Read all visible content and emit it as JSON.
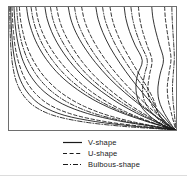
{
  "figure": {
    "width": 187,
    "height": 183,
    "background": "#ffffff",
    "frame_color": "#6e6e6e",
    "line_color": "#1a1a1a"
  },
  "legend": {
    "position": "below-plot",
    "entries": [
      {
        "label": "V-shape",
        "style": "solid",
        "color": "#1a1a1a"
      },
      {
        "label": "U-shape",
        "style": "dashed",
        "color": "#1a1a1a"
      },
      {
        "label": "Bulbous-shape",
        "style": "dashdot",
        "color": "#1a1a1a"
      }
    ]
  },
  "chart_data": {
    "type": "line",
    "title": "",
    "subtitle": "",
    "xlabel": "",
    "ylabel": "",
    "xlim": [
      0,
      1
    ],
    "ylim": [
      0,
      1
    ],
    "xticks": [],
    "yticks": [],
    "xticklabels": [],
    "yticklabels": [],
    "grid": false,
    "legend_position": "below",
    "annotations": [],
    "series": [
      {
        "name": "V-shape",
        "style": "solid",
        "color": "#1a1a1a",
        "curves": [
          {
            "x": [
              0.01,
              0.012,
              0.016,
              0.024,
              0.04,
              0.07,
              0.12,
              0.2,
              0.33,
              0.52,
              0.74,
              0.92,
              0.985
            ],
            "y": [
              1.0,
              0.9,
              0.79,
              0.66,
              0.53,
              0.4,
              0.29,
              0.195,
              0.12,
              0.068,
              0.032,
              0.01,
              0.002
            ]
          },
          {
            "x": [
              0.03,
              0.034,
              0.042,
              0.058,
              0.086,
              0.135,
              0.21,
              0.32,
              0.47,
              0.65,
              0.83,
              0.945,
              0.992
            ],
            "y": [
              1.0,
              0.905,
              0.8,
              0.68,
              0.555,
              0.428,
              0.312,
              0.212,
              0.134,
              0.076,
              0.036,
              0.012,
              0.002
            ]
          },
          {
            "x": [
              0.105,
              0.115,
              0.135,
              0.17,
              0.225,
              0.305,
              0.41,
              0.535,
              0.67,
              0.8,
              0.9,
              0.96,
              0.995
            ],
            "y": [
              1.0,
              0.91,
              0.81,
              0.695,
              0.572,
              0.445,
              0.328,
              0.224,
              0.142,
              0.08,
              0.038,
              0.013,
              0.002
            ]
          },
          {
            "x": [
              0.215,
              0.228,
              0.255,
              0.3,
              0.365,
              0.45,
              0.552,
              0.66,
              0.765,
              0.858,
              0.925,
              0.97,
              0.996
            ],
            "y": [
              1.0,
              0.905,
              0.8,
              0.682,
              0.556,
              0.43,
              0.315,
              0.215,
              0.136,
              0.078,
              0.037,
              0.012,
              0.002
            ]
          },
          {
            "x": [
              0.355,
              0.37,
              0.4,
              0.45,
              0.518,
              0.6,
              0.69,
              0.778,
              0.855,
              0.915,
              0.955,
              0.98,
              0.997
            ],
            "y": [
              1.0,
              0.902,
              0.795,
              0.675,
              0.548,
              0.422,
              0.308,
              0.21,
              0.133,
              0.075,
              0.035,
              0.012,
              0.002
            ]
          },
          {
            "x": [
              0.52,
              0.534,
              0.562,
              0.606,
              0.665,
              0.732,
              0.8,
              0.862,
              0.912,
              0.948,
              0.972,
              0.988,
              0.998
            ],
            "y": [
              1.0,
              0.9,
              0.792,
              0.67,
              0.542,
              0.416,
              0.302,
              0.205,
              0.13,
              0.073,
              0.034,
              0.011,
              0.002
            ]
          },
          {
            "x": [
              0.69,
              0.7,
              0.722,
              0.755,
              0.798,
              0.77,
              0.76,
              0.772,
              0.805,
              0.855,
              0.905,
              0.955,
              0.998
            ],
            "y": [
              1.0,
              0.905,
              0.8,
              0.69,
              0.565,
              0.45,
              0.345,
              0.248,
              0.166,
              0.1,
              0.052,
              0.018,
              0.002
            ]
          },
          {
            "x": [
              0.855,
              0.862,
              0.878,
              0.9,
              0.925,
              0.905,
              0.892,
              0.896,
              0.918,
              0.945,
              0.968,
              0.985,
              0.999
            ],
            "y": [
              1.0,
              0.908,
              0.806,
              0.696,
              0.572,
              0.455,
              0.35,
              0.252,
              0.168,
              0.102,
              0.053,
              0.018,
              0.002
            ]
          }
        ]
      },
      {
        "name": "U-shape",
        "style": "dashed",
        "color": "#1a1a1a",
        "curves": [
          {
            "x": [
              0.018,
              0.021,
              0.027,
              0.038,
              0.06,
              0.098,
              0.158,
              0.248,
              0.385,
              0.57,
              0.775,
              0.93,
              0.988
            ],
            "y": [
              1.0,
              0.902,
              0.794,
              0.668,
              0.538,
              0.41,
              0.297,
              0.2,
              0.125,
              0.07,
              0.033,
              0.011,
              0.002
            ]
          },
          {
            "x": [
              0.062,
              0.068,
              0.082,
              0.106,
              0.148,
              0.212,
              0.3,
              0.415,
              0.552,
              0.705,
              0.85,
              0.95,
              0.993
            ],
            "y": [
              1.0,
              0.906,
              0.802,
              0.684,
              0.558,
              0.432,
              0.316,
              0.216,
              0.137,
              0.078,
              0.037,
              0.012,
              0.002
            ]
          },
          {
            "x": [
              0.16,
              0.172,
              0.196,
              0.238,
              0.3,
              0.382,
              0.482,
              0.595,
              0.712,
              0.822,
              0.908,
              0.962,
              0.996
            ],
            "y": [
              1.0,
              0.908,
              0.806,
              0.69,
              0.566,
              0.44,
              0.323,
              0.221,
              0.14,
              0.079,
              0.038,
              0.013,
              0.002
            ]
          },
          {
            "x": [
              0.285,
              0.3,
              0.328,
              0.375,
              0.44,
              0.522,
              0.618,
              0.715,
              0.805,
              0.88,
              0.935,
              0.972,
              0.997
            ],
            "y": [
              1.0,
              0.904,
              0.798,
              0.68,
              0.552,
              0.426,
              0.311,
              0.212,
              0.134,
              0.076,
              0.036,
              0.012,
              0.002
            ]
          },
          {
            "x": [
              0.435,
              0.45,
              0.48,
              0.528,
              0.592,
              0.668,
              0.748,
              0.822,
              0.884,
              0.932,
              0.964,
              0.984,
              0.998
            ],
            "y": [
              1.0,
              0.901,
              0.793,
              0.672,
              0.544,
              0.418,
              0.304,
              0.207,
              0.131,
              0.074,
              0.035,
              0.011,
              0.002
            ]
          },
          {
            "x": [
              0.605,
              0.618,
              0.644,
              0.684,
              0.736,
              0.79,
              0.838,
              0.872,
              0.89,
              0.912,
              0.945,
              0.975,
              0.998
            ],
            "y": [
              1.0,
              0.903,
              0.796,
              0.678,
              0.552,
              0.43,
              0.322,
              0.226,
              0.15,
              0.09,
              0.045,
              0.015,
              0.002
            ]
          },
          {
            "x": [
              0.775,
              0.783,
              0.8,
              0.826,
              0.856,
              0.842,
              0.832,
              0.84,
              0.87,
              0.91,
              0.948,
              0.976,
              0.999
            ],
            "y": [
              1.0,
              0.906,
              0.802,
              0.692,
              0.568,
              0.452,
              0.348,
              0.25,
              0.167,
              0.101,
              0.052,
              0.018,
              0.002
            ]
          },
          {
            "x": [
              0.932,
              0.936,
              0.946,
              0.958,
              0.97,
              0.958,
              0.948,
              0.952,
              0.966,
              0.978,
              0.988,
              0.995,
              0.999
            ],
            "y": [
              1.0,
              0.91,
              0.81,
              0.7,
              0.578,
              0.46,
              0.355,
              0.256,
              0.172,
              0.105,
              0.055,
              0.019,
              0.002
            ]
          }
        ]
      },
      {
        "name": "Bulbous-shape",
        "style": "dashdot",
        "color": "#1a1a1a",
        "curves": [
          {
            "x": [
              0.004,
              0.005,
              0.007,
              0.012,
              0.022,
              0.044,
              0.085,
              0.155,
              0.27,
              0.45,
              0.68,
              0.89,
              0.982
            ],
            "y": [
              1.0,
              0.898,
              0.786,
              0.656,
              0.524,
              0.394,
              0.284,
              0.19,
              0.117,
              0.065,
              0.03,
              0.01,
              0.002
            ]
          },
          {
            "x": [
              0.046,
              0.051,
              0.062,
              0.082,
              0.118,
              0.174,
              0.255,
              0.366,
              0.508,
              0.672,
              0.838,
              0.946,
              0.992
            ],
            "y": [
              1.0,
              0.904,
              0.798,
              0.68,
              0.555,
              0.43,
              0.314,
              0.214,
              0.135,
              0.077,
              0.036,
              0.012,
              0.002
            ]
          },
          {
            "x": [
              0.132,
              0.143,
              0.165,
              0.202,
              0.26,
              0.34,
              0.442,
              0.562,
              0.69,
              0.81,
              0.904,
              0.96,
              0.996
            ],
            "y": [
              1.0,
              0.908,
              0.806,
              0.692,
              0.568,
              0.442,
              0.325,
              0.222,
              0.141,
              0.08,
              0.038,
              0.013,
              0.002
            ]
          },
          {
            "x": [
              0.248,
              0.262,
              0.29,
              0.336,
              0.4,
              0.484,
              0.584,
              0.688,
              0.786,
              0.868,
              0.928,
              0.968,
              0.997
            ],
            "y": [
              1.0,
              0.904,
              0.798,
              0.68,
              0.554,
              0.428,
              0.313,
              0.213,
              0.135,
              0.077,
              0.036,
              0.012,
              0.002
            ]
          },
          {
            "x": [
              0.392,
              0.406,
              0.436,
              0.484,
              0.55,
              0.628,
              0.712,
              0.792,
              0.862,
              0.918,
              0.956,
              0.98,
              0.998
            ],
            "y": [
              1.0,
              0.901,
              0.794,
              0.674,
              0.546,
              0.42,
              0.306,
              0.208,
              0.132,
              0.074,
              0.035,
              0.011,
              0.002
            ]
          },
          {
            "x": [
              0.56,
              0.574,
              0.602,
              0.644,
              0.7,
              0.762,
              0.818,
              0.862,
              0.888,
              0.918,
              0.948,
              0.976,
              0.998
            ],
            "y": [
              1.0,
              0.902,
              0.795,
              0.676,
              0.55,
              0.428,
              0.322,
              0.228,
              0.152,
              0.092,
              0.046,
              0.016,
              0.002
            ]
          },
          {
            "x": [
              0.73,
              0.74,
              0.76,
              0.79,
              0.828,
              0.812,
              0.8,
              0.808,
              0.84,
              0.884,
              0.928,
              0.966,
              0.999
            ],
            "y": [
              1.0,
              0.905,
              0.801,
              0.691,
              0.566,
              0.451,
              0.346,
              0.249,
              0.166,
              0.1,
              0.052,
              0.018,
              0.002
            ]
          },
          {
            "x": [
              0.975,
              0.977,
              0.981,
              0.986,
              0.99,
              0.984,
              0.979,
              0.981,
              0.987,
              0.992,
              0.996,
              0.998,
              1.0
            ],
            "y": [
              1.0,
              0.912,
              0.812,
              0.704,
              0.582,
              0.464,
              0.358,
              0.258,
              0.174,
              0.106,
              0.056,
              0.02,
              0.002
            ]
          }
        ]
      }
    ]
  }
}
